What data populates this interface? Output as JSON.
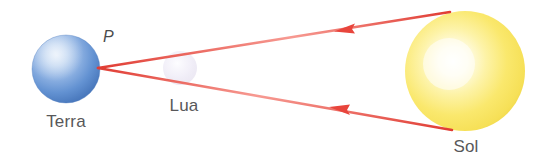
{
  "figure": {
    "background_color": "#ffffff",
    "width": 543,
    "height": 163
  },
  "labels": {
    "earth": "Terra",
    "moon": "Lua",
    "sun": "Sol",
    "point": "P",
    "text_color": "#58585a"
  },
  "bodies": {
    "earth": {
      "name": "Terra",
      "center_x": 66,
      "center_y": 69,
      "radius": 34,
      "color_light": "#cfe0f4",
      "color_mid": "#7fa8dd",
      "color_dark": "#4b79bd",
      "color_edge": "#3f6bb0"
    },
    "moon": {
      "name": "Lua",
      "center_x": 180,
      "center_y": 68,
      "radius": 17,
      "color_light": "#fbfbfe",
      "color_mid": "#ece9f4",
      "color_dark": "#d9d4e8"
    },
    "sun": {
      "name": "Sol",
      "center_x": 465,
      "center_y": 71,
      "radius": 60,
      "color_core": "#ffffff",
      "color_light": "#fdf6b8",
      "color_mid": "#f9e86a",
      "color_dark": "#f2dc54",
      "color_edge": "#ecd245"
    }
  },
  "rays": {
    "color": "#e8453c",
    "core_color": "#f7948d",
    "width": 2,
    "direction": "sun-to-earth",
    "upper": {
      "from_x": 450,
      "from_y": 12,
      "to_x": 98,
      "to_y": 68,
      "arrow_x": 345,
      "arrow_y": 28
    },
    "lower": {
      "from_x": 452,
      "from_y": 130,
      "to_x": 98,
      "to_y": 68,
      "arrow_x": 340,
      "arrow_y": 110
    },
    "vertex_x": 98,
    "vertex_y": 68
  }
}
